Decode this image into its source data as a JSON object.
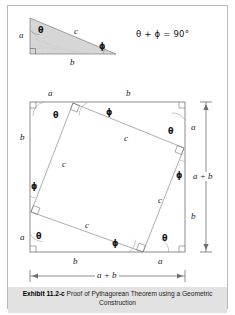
{
  "figure": {
    "caption_label": "Exhibit 11.2-c",
    "caption_text": " Proof of Pythagorean Theorem using a Geometric Construction",
    "equation": "θ + ϕ = 90°"
  },
  "symbols": {
    "a": "a",
    "b": "b",
    "c": "c",
    "theta": "θ",
    "phi": "ϕ",
    "a_plus_b": "a + b"
  },
  "top_triangle": {
    "side_a": "a",
    "side_b": "b",
    "side_c": "c",
    "angle_theta": "θ",
    "angle_phi": "ϕ"
  },
  "square_figure": {
    "top_edge": [
      "a",
      "b"
    ],
    "left_edge": [
      "b",
      "a"
    ],
    "bottom_edge": [
      "b",
      "a"
    ],
    "right_edge": [
      "a",
      "b"
    ],
    "inner_sides": [
      "c",
      "c",
      "c",
      "c"
    ],
    "inner_angles": [
      "θ",
      "ϕ",
      "θ",
      "ϕ",
      "θ",
      "ϕ",
      "θ",
      "ϕ"
    ],
    "vertical_dimension": "a + b",
    "horizontal_dimension": "a + b"
  },
  "colors": {
    "triangle_fill": "#d6d6d6",
    "line": "#6f6f6f",
    "caption_bg": "#e2e2e2",
    "page_bg": "#ffffff"
  }
}
